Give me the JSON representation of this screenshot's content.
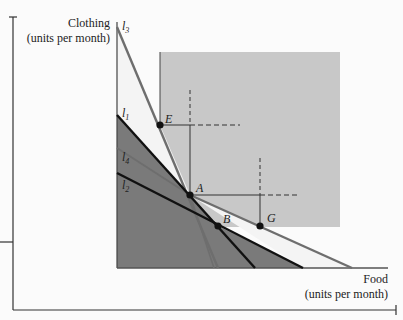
{
  "diagram": {
    "y_axis_label": "Clothing",
    "y_axis_units": "(units per month)",
    "x_axis_label": "Food",
    "x_axis_units": "(units per month)",
    "curves": {
      "I1": "l",
      "I1_sub": "1",
      "I2": "l",
      "I2_sub": "2",
      "I3": "l",
      "I3_sub": "3",
      "I4": "l",
      "I4_sub": "4"
    },
    "points": {
      "A": "A",
      "B": "B",
      "E": "E",
      "G": "G"
    },
    "colors": {
      "light_region": "#c8c8c8",
      "dark_region": "#7a7a7a",
      "line_dark": "#111111",
      "line_gray": "#6e6e6e"
    }
  }
}
